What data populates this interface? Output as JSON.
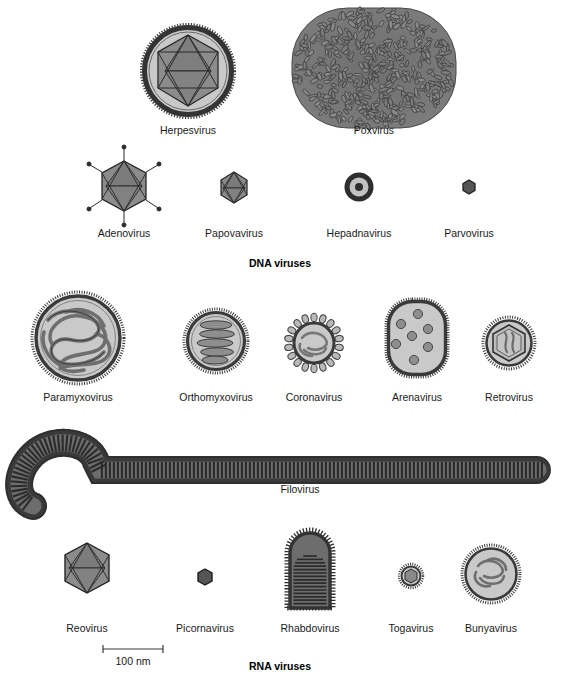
{
  "figure": {
    "title_dna": "DNA viruses",
    "title_rna": "RNA viruses",
    "background": "#ffffff",
    "ink": "#1a1a1a",
    "envelope_color": "#4a4a4a",
    "lumen_color": "#c9c9c9",
    "capsid_color": "#8a8a8a"
  },
  "scale_bar": {
    "label": "100 nm",
    "length_px": 60,
    "x_start": 103,
    "x_end": 163,
    "y": 653
  },
  "groups": [
    {
      "name": "dna-viruses",
      "label": "DNA viruses",
      "label_x": 280,
      "label_y": 267,
      "rows": [
        {
          "name": "dna-row-1",
          "viruses": [
            {
              "name": "herpesvirus",
              "label": "Herpesvirus",
              "shape": "enveloped-icosahedral",
              "cx": 188,
              "cy": 71,
              "r": 47,
              "label_x": 188,
              "label_y": 134,
              "features": [
                "spiked-envelope",
                "icosahedral-capsid",
                "tegument"
              ]
            },
            {
              "name": "poxvirus",
              "label": "Poxvirus",
              "shape": "brick-complex",
              "cx": 374,
              "cy": 68,
              "rx": 82,
              "ry": 62,
              "label_x": 374,
              "label_y": 134,
              "features": [
                "ovoid-granule-mass"
              ]
            }
          ]
        },
        {
          "name": "dna-row-2",
          "viruses": [
            {
              "name": "adenovirus",
              "label": "Adenovirus",
              "shape": "icosahedral-fibers",
              "cx": 124,
              "cy": 186,
              "r": 25,
              "label_x": 124,
              "label_y": 237,
              "features": [
                "icosahedron",
                "penton-fibers"
              ]
            },
            {
              "name": "papovavirus",
              "label": "Papovavirus",
              "shape": "icosahedral",
              "cx": 234,
              "cy": 187,
              "r": 15,
              "label_x": 234,
              "label_y": 237,
              "features": [
                "icosahedron"
              ]
            },
            {
              "name": "hepadnavirus",
              "label": "Hepadnavirus",
              "shape": "concentric-rings",
              "cx": 359,
              "cy": 187,
              "r": 15,
              "label_x": 359,
              "label_y": 237,
              "features": [
                "envelope-ring",
                "core-dot"
              ]
            },
            {
              "name": "parvovirus",
              "label": "Parvovirus",
              "shape": "tiny-icosahedral",
              "cx": 469,
              "cy": 187,
              "r": 7,
              "label_x": 469,
              "label_y": 237,
              "features": [
                "small-icosahedron"
              ]
            }
          ]
        }
      ]
    },
    {
      "name": "rna-viruses",
      "label": "RNA viruses",
      "label_x": 280,
      "label_y": 670,
      "rows": [
        {
          "name": "rna-row-1",
          "viruses": [
            {
              "name": "paramyxovirus",
              "label": "Paramyxovirus",
              "shape": "enveloped-helical-tangle",
              "cx": 78,
              "cy": 338,
              "r": 46,
              "label_x": 78,
              "label_y": 401,
              "features": [
                "spiked-envelope",
                "tangled-nucleocapsid"
              ]
            },
            {
              "name": "orthomyxovirus",
              "label": "Orthomyxovirus",
              "shape": "enveloped-helical-coil",
              "cx": 216,
              "cy": 341,
              "r": 32,
              "label_x": 216,
              "label_y": 401,
              "features": [
                "spiked-envelope",
                "coiled-nucleocapsid"
              ]
            },
            {
              "name": "coronavirus",
              "label": "Coronavirus",
              "shape": "enveloped-club-spikes",
              "cx": 314,
              "cy": 343,
              "r": 24,
              "label_x": 314,
              "label_y": 401,
              "features": [
                "club-shaped-peplomers",
                "helical-core"
              ]
            },
            {
              "name": "arenavirus",
              "label": "Arenavirus",
              "shape": "enveloped-granular",
              "cx": 417,
              "cy": 338,
              "rx": 30,
              "ry": 38,
              "label_x": 417,
              "label_y": 401,
              "features": [
                "spiked-envelope",
                "ribosome-granules"
              ]
            },
            {
              "name": "retrovirus",
              "label": "Retrovirus",
              "shape": "enveloped-hex-core",
              "cx": 509,
              "cy": 343,
              "r": 26,
              "label_x": 509,
              "label_y": 401,
              "features": [
                "spiked-envelope",
                "hexagonal-core",
                "rna-strands"
              ]
            }
          ]
        },
        {
          "name": "rna-row-2",
          "viruses": [
            {
              "name": "filovirus",
              "label": "Filovirus",
              "shape": "filamentous-hooked",
              "label_x": 300,
              "label_y": 493,
              "features": [
                "shepherds-crook",
                "cross-striations",
                "spiked-surface"
              ]
            }
          ]
        },
        {
          "name": "rna-row-3",
          "viruses": [
            {
              "name": "reovirus",
              "label": "Reovirus",
              "shape": "icosahedral",
              "cx": 87,
              "cy": 568,
              "r": 25,
              "label_x": 87,
              "label_y": 632,
              "features": [
                "double-capsid-icosahedron"
              ]
            },
            {
              "name": "picornavirus",
              "label": "Picornavirus",
              "shape": "tiny-icosahedral",
              "cx": 205,
              "cy": 577,
              "r": 8,
              "label_x": 205,
              "label_y": 632,
              "features": [
                "small-icosahedron"
              ]
            },
            {
              "name": "rhabdovirus",
              "label": "Rhabdovirus",
              "shape": "bullet",
              "cx": 310,
              "cy": 578,
              "w": 46,
              "h": 96,
              "label_x": 310,
              "label_y": 632,
              "features": [
                "bullet-shape",
                "cross-striations",
                "spiked-surface"
              ]
            },
            {
              "name": "togavirus",
              "label": "Togavirus",
              "shape": "enveloped-icosahedral-small",
              "cx": 411,
              "cy": 576,
              "r": 12,
              "label_x": 411,
              "label_y": 632,
              "features": [
                "envelope",
                "icosahedral-core"
              ]
            },
            {
              "name": "bunyavirus",
              "label": "Bunyavirus",
              "shape": "enveloped-helical-tangle",
              "cx": 491,
              "cy": 574,
              "r": 29,
              "label_x": 491,
              "label_y": 632,
              "features": [
                "spiked-envelope",
                "tangled-nucleocapsid"
              ]
            }
          ]
        }
      ]
    }
  ]
}
